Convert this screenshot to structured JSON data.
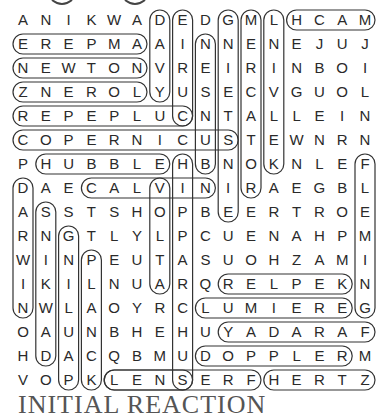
{
  "puzzle": {
    "rows": [
      "ANIKWADEDGMLHCAM",
      "EREPMAAINNENEJUJ",
      "NEWTONVREIRINBOI",
      "ZNEROLYUSECVGUOL",
      "REPEPLUCNTALLEIN",
      "COPERNICUSTEWNRN",
      "PHUBBLEHBNOKNLEF",
      "DAECALVINIRAEGBL",
      "ASSTSHOPBEERTROE",
      "RNGTLYLPCUENAHPM",
      "WINPEUTASUOHZAMI",
      "IKILNUARQRELPEKN",
      "NWLAOYRCLUMIEREG",
      "OAUNBHEHUYADARAF",
      "HDACQBMUDOPPLERM",
      "VOPKLENSERFHERTZ"
    ],
    "found_words": [
      {
        "word": "AMPERE",
        "from": [
          1,
          5
        ],
        "to": [
          1,
          0
        ]
      },
      {
        "word": "NEWTON",
        "from": [
          2,
          0
        ],
        "to": [
          2,
          5
        ]
      },
      {
        "word": "LORENZ",
        "from": [
          3,
          5
        ],
        "to": [
          3,
          0
        ]
      },
      {
        "word": "CULPEPER",
        "from": [
          4,
          7
        ],
        "to": [
          4,
          0
        ]
      },
      {
        "word": "COPERNICUS",
        "from": [
          5,
          0
        ],
        "to": [
          5,
          9
        ]
      },
      {
        "word": "HUBBLE",
        "from": [
          6,
          1
        ],
        "to": [
          6,
          6
        ]
      },
      {
        "word": "CALVIN",
        "from": [
          7,
          3
        ],
        "to": [
          7,
          8
        ]
      },
      {
        "word": "KEPLER",
        "from": [
          11,
          14
        ],
        "to": [
          11,
          9
        ]
      },
      {
        "word": "LUMIERE",
        "from": [
          12,
          8
        ],
        "to": [
          12,
          14
        ]
      },
      {
        "word": "FARADAY",
        "from": [
          13,
          15
        ],
        "to": [
          13,
          9
        ]
      },
      {
        "word": "DOPPLER",
        "from": [
          14,
          8
        ],
        "to": [
          14,
          14
        ]
      },
      {
        "word": "LENS",
        "from": [
          15,
          4
        ],
        "to": [
          15,
          7
        ]
      },
      {
        "word": "FRESNEL",
        "from": [
          15,
          10
        ],
        "to": [
          15,
          4
        ]
      },
      {
        "word": "HERTZ",
        "from": [
          15,
          11
        ],
        "to": [
          15,
          15
        ]
      },
      {
        "word": "MACH",
        "from": [
          0,
          15
        ],
        "to": [
          0,
          12
        ]
      },
      {
        "word": "DAVY",
        "from": [
          0,
          6
        ],
        "to": [
          3,
          6
        ]
      },
      {
        "word": "EIRUC",
        "from": [
          0,
          7
        ],
        "to": [
          4,
          7
        ]
      },
      {
        "word": "NESNUB",
        "from": [
          1,
          8
        ],
        "to": [
          6,
          8
        ]
      },
      {
        "word": "GNIETSNIE",
        "from": [
          0,
          9
        ],
        "to": [
          8,
          9
        ]
      },
      {
        "word": "MERCATOR",
        "from": [
          0,
          10
        ],
        "to": [
          7,
          10
        ]
      },
      {
        "word": "LNIVLEK",
        "from": [
          0,
          11
        ],
        "to": [
          6,
          11
        ]
      },
      {
        "word": "FLEMING",
        "from": [
          6,
          15
        ],
        "to": [
          12,
          15
        ]
      },
      {
        "word": "HIPPARCHUS",
        "from": [
          6,
          7
        ],
        "to": [
          15,
          7
        ]
      },
      {
        "word": "VOLTA",
        "from": [
          7,
          6
        ],
        "to": [
          11,
          6
        ]
      },
      {
        "word": "DARWIN",
        "from": [
          7,
          0
        ],
        "to": [
          12,
          0
        ]
      },
      {
        "word": "SNIKWAH",
        "from": [
          8,
          1
        ],
        "to": [
          14,
          1
        ]
      },
      {
        "word": "GNILUAP",
        "from": [
          9,
          2
        ],
        "to": [
          15,
          2
        ]
      },
      {
        "word": "PLANCK",
        "from": [
          10,
          3
        ],
        "to": [
          15,
          3
        ]
      }
    ],
    "footer_text": "INITIAL REACTION"
  }
}
